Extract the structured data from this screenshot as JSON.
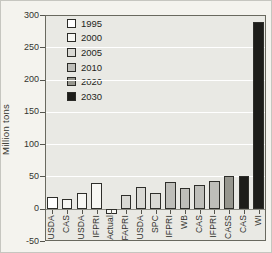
{
  "figure": {
    "background": "#f4f3ee",
    "plot_background": "#e9e9e4",
    "gridline_color": "#ffffff",
    "frame_color": "#69695f",
    "bar_border_color": "#2e2e2a"
  },
  "chart_data": {
    "type": "bar",
    "title": "",
    "xlabel": "",
    "ylabel": "Million tons",
    "ylim": [
      -50,
      300
    ],
    "yticks": [
      300,
      250,
      200,
      150,
      100,
      50,
      0,
      -50
    ],
    "gridlines_at": [
      250,
      200,
      150,
      100,
      50
    ],
    "grid": "horizontal white lines on gray plot background",
    "legend_position": "upper-left inside plot, no box",
    "legend": [
      {
        "label": "1995",
        "color": "#ffffff"
      },
      {
        "label": "2000",
        "color": "#f7f7f3"
      },
      {
        "label": "2005",
        "color": "#d9d9d4"
      },
      {
        "label": "2010",
        "color": "#bebeb9"
      },
      {
        "label": "2020",
        "color": "#96968e"
      },
      {
        "label": "2030",
        "color": "#1d1d1a"
      }
    ],
    "categories": [
      "USDA",
      "CAS",
      "USDA",
      "IFPRI",
      "Actual",
      "FAPRI",
      "USDA",
      "SPC",
      "IFPRI",
      "WB",
      "CAS",
      "IFPRI",
      "CASS",
      "CAS",
      "WI"
    ],
    "bars": [
      {
        "category": "USDA",
        "value": 18,
        "year": "1995"
      },
      {
        "category": "CAS",
        "value": 15,
        "year": "2000"
      },
      {
        "category": "USDA",
        "value": 25,
        "year": "2000"
      },
      {
        "category": "IFPRI",
        "value": 40,
        "year": "2000"
      },
      {
        "category": "Actual",
        "value": -8,
        "year": "2000"
      },
      {
        "category": "FAPRI",
        "value": 22,
        "year": "2005"
      },
      {
        "category": "USDA",
        "value": 33,
        "year": "2005"
      },
      {
        "category": "SPC",
        "value": 24,
        "year": "2005"
      },
      {
        "category": "IFPRI",
        "value": 42,
        "year": "2010"
      },
      {
        "category": "WB",
        "value": 32,
        "year": "2010"
      },
      {
        "category": "CAS",
        "value": 37,
        "year": "2010"
      },
      {
        "category": "IFPRI",
        "value": 43,
        "year": "2010"
      },
      {
        "category": "CASS",
        "value": 50,
        "year": "2020"
      },
      {
        "category": "CAS",
        "value": 50,
        "year": "2030"
      },
      {
        "category": "WI",
        "value": 290,
        "year": "2030"
      }
    ]
  }
}
